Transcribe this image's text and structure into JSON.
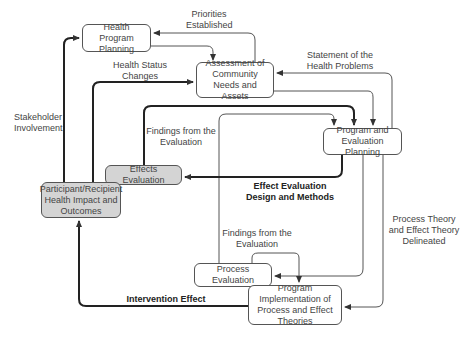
{
  "diagram": {
    "nodes": {
      "health_program_planning": "Health Program Planning",
      "assessment": "Assessment of Community Needs and Assets",
      "program_evaluation_planning": "Program and Evaluation Planning",
      "effects_evaluation": "Effects Evaluation",
      "participant_outcomes": "Participant/Recipient Health Impact and Outcomes",
      "process_evaluation": "Process Evaluation",
      "program_implementation": "Program Implementation of Process and Effect Theories"
    },
    "edge_labels": {
      "priorities_established": "Priorities Established",
      "health_status_changes": "Health Status Changes",
      "statement_health_problems": "Statement of the Health Problems",
      "stakeholder_involvement": "Stakeholder Involvement",
      "findings_effects": "Findings from the Evaluation",
      "effect_eval_design": "Effect Evaluation Design and Methods",
      "process_theory": "Process Theory and Effect Theory Delineated",
      "findings_process": "Findings from the Evaluation",
      "intervention_effect": "Intervention Effect"
    }
  }
}
